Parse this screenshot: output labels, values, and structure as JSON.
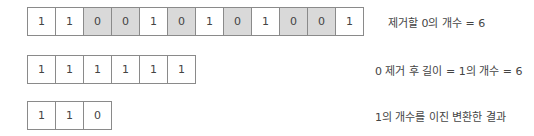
{
  "rows": [
    {
      "cells": [
        "1",
        "1",
        "0",
        "0",
        "1",
        "0",
        "1",
        "0",
        "1",
        "0",
        "0",
        "1"
      ],
      "shaded": [
        false,
        false,
        true,
        true,
        false,
        true,
        false,
        true,
        false,
        true,
        true,
        false
      ],
      "label": "제거할 0의 개수 = 6"
    },
    {
      "cells": [
        "1",
        "1",
        "1",
        "1",
        "1",
        "1"
      ],
      "shaded": [
        false,
        false,
        false,
        false,
        false,
        false
      ],
      "label": "0 제거 후 길이 = 1의 개수 = 6"
    },
    {
      "cells": [
        "1",
        "1",
        "0"
      ],
      "shaded": [
        false,
        false,
        false
      ],
      "label": "1의 개수를 이진 변환한 결과"
    }
  ],
  "colors": {
    "shaded": "#d9d9d9",
    "border": "#8a8a8a"
  }
}
